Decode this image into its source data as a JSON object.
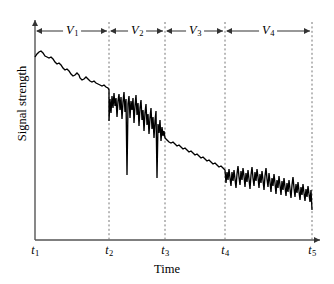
{
  "chart_data": {
    "type": "line",
    "title": "",
    "xlabel": "Time",
    "ylabel": "Signal strength",
    "grid": false,
    "legend": null,
    "axis_style": "arrow-headed axes, no numeric ticks",
    "xticks": [
      {
        "id": "t1",
        "label": "t",
        "sub": "1",
        "x_px": 35
      },
      {
        "id": "t2",
        "label": "t",
        "sub": "2",
        "x_px": 109
      },
      {
        "id": "t3",
        "label": "t",
        "sub": "3",
        "x_px": 165
      },
      {
        "id": "t4",
        "label": "t",
        "sub": "4",
        "x_px": 225
      },
      {
        "id": "t5",
        "label": "t",
        "sub": "5",
        "x_px": 312
      }
    ],
    "segments": [
      {
        "id": "V1",
        "label": "V",
        "sub": "1",
        "from": "t1",
        "to": "t2",
        "center_px": 72,
        "description": "slow smooth decline, low variance ripple"
      },
      {
        "id": "V2",
        "label": "V",
        "sub": "2",
        "from": "t2",
        "to": "t3",
        "center_px": 137,
        "description": "steep decline with very large rapid fading spikes"
      },
      {
        "id": "V3",
        "label": "V",
        "sub": "3",
        "from": "t3",
        "to": "t4",
        "center_px": 195,
        "description": "gentle decline, small ripple"
      },
      {
        "id": "V4",
        "label": "V",
        "sub": "4",
        "from": "t4",
        "to": "t5",
        "center_px": 268,
        "description": "slow decline with medium rapid fading oscillation"
      }
    ],
    "series": [
      {
        "name": "signal",
        "points": [
          [
            35,
            57
          ],
          [
            37,
            54
          ],
          [
            39,
            52
          ],
          [
            41,
            51
          ],
          [
            43,
            53
          ],
          [
            45,
            56
          ],
          [
            47,
            57
          ],
          [
            49,
            58
          ],
          [
            51,
            57
          ],
          [
            53,
            59
          ],
          [
            55,
            62
          ],
          [
            57,
            64
          ],
          [
            59,
            63
          ],
          [
            61,
            65
          ],
          [
            63,
            68
          ],
          [
            65,
            70
          ],
          [
            67,
            69
          ],
          [
            69,
            71
          ],
          [
            71,
            74
          ],
          [
            73,
            76
          ],
          [
            75,
            75
          ],
          [
            77,
            73
          ],
          [
            79,
            75
          ],
          [
            80,
            78
          ],
          [
            82,
            80
          ],
          [
            84,
            79
          ],
          [
            86,
            77
          ],
          [
            88,
            79
          ],
          [
            90,
            81
          ],
          [
            92,
            82
          ],
          [
            94,
            81
          ],
          [
            96,
            83
          ],
          [
            98,
            84
          ],
          [
            100,
            85
          ],
          [
            102,
            86
          ],
          [
            104,
            85
          ],
          [
            106,
            87
          ],
          [
            108,
            88
          ],
          [
            109,
            90
          ],
          [
            109,
            121
          ],
          [
            110,
            99
          ],
          [
            111,
            113
          ],
          [
            112,
            96
          ],
          [
            113,
            108
          ],
          [
            114,
            93
          ],
          [
            115,
            106
          ],
          [
            116,
            98
          ],
          [
            117,
            117
          ],
          [
            118,
            101
          ],
          [
            119,
            94
          ],
          [
            120,
            110
          ],
          [
            121,
            97
          ],
          [
            122,
            119
          ],
          [
            123,
            102
          ],
          [
            124,
            92
          ],
          [
            125,
            112
          ],
          [
            126,
            99
          ],
          [
            127,
            175
          ],
          [
            128,
            104
          ],
          [
            129,
            96
          ],
          [
            130,
            118
          ],
          [
            131,
            101
          ],
          [
            132,
            110
          ],
          [
            133,
            98
          ],
          [
            134,
            123
          ],
          [
            135,
            106
          ],
          [
            136,
            95
          ],
          [
            137,
            115
          ],
          [
            138,
            103
          ],
          [
            139,
            126
          ],
          [
            140,
            108
          ],
          [
            141,
            100
          ],
          [
            142,
            120
          ],
          [
            143,
            110
          ],
          [
            144,
            131
          ],
          [
            145,
            113
          ],
          [
            146,
            104
          ],
          [
            147,
            125
          ],
          [
            148,
            114
          ],
          [
            149,
            134
          ],
          [
            150,
            118
          ],
          [
            151,
            108
          ],
          [
            152,
            129
          ],
          [
            153,
            117
          ],
          [
            154,
            138
          ],
          [
            155,
            121
          ],
          [
            156,
            111
          ],
          [
            157,
            178
          ],
          [
            158,
            124
          ],
          [
            159,
            133
          ],
          [
            160,
            120
          ],
          [
            161,
            141
          ],
          [
            162,
            127
          ],
          [
            163,
            136
          ],
          [
            164,
            131
          ],
          [
            165,
            138
          ],
          [
            167,
            140
          ],
          [
            169,
            142
          ],
          [
            171,
            143
          ],
          [
            173,
            142
          ],
          [
            175,
            144
          ],
          [
            177,
            146
          ],
          [
            179,
            145
          ],
          [
            181,
            147
          ],
          [
            183,
            149
          ],
          [
            185,
            148
          ],
          [
            187,
            150
          ],
          [
            189,
            152
          ],
          [
            191,
            151
          ],
          [
            193,
            153
          ],
          [
            195,
            155
          ],
          [
            197,
            154
          ],
          [
            199,
            156
          ],
          [
            201,
            158
          ],
          [
            203,
            157
          ],
          [
            205,
            159
          ],
          [
            207,
            161
          ],
          [
            209,
            160
          ],
          [
            211,
            162
          ],
          [
            213,
            164
          ],
          [
            215,
            163
          ],
          [
            217,
            165
          ],
          [
            219,
            167
          ],
          [
            221,
            166
          ],
          [
            223,
            168
          ],
          [
            225,
            170
          ],
          [
            226,
            183
          ],
          [
            227,
            172
          ],
          [
            228,
            180
          ],
          [
            229,
            169
          ],
          [
            230,
            178
          ],
          [
            231,
            186
          ],
          [
            232,
            172
          ],
          [
            233,
            181
          ],
          [
            234,
            170
          ],
          [
            235,
            179
          ],
          [
            236,
            188
          ],
          [
            237,
            174
          ],
          [
            238,
            166
          ],
          [
            239,
            177
          ],
          [
            240,
            185
          ],
          [
            241,
            171
          ],
          [
            242,
            180
          ],
          [
            243,
            168
          ],
          [
            244,
            176
          ],
          [
            245,
            187
          ],
          [
            246,
            173
          ],
          [
            247,
            182
          ],
          [
            248,
            170
          ],
          [
            249,
            179
          ],
          [
            250,
            189
          ],
          [
            251,
            175
          ],
          [
            252,
            167
          ],
          [
            253,
            178
          ],
          [
            254,
            186
          ],
          [
            255,
            172
          ],
          [
            256,
            181
          ],
          [
            257,
            169
          ],
          [
            258,
            177
          ],
          [
            259,
            188
          ],
          [
            260,
            174
          ],
          [
            261,
            183
          ],
          [
            262,
            171
          ],
          [
            263,
            180
          ],
          [
            264,
            190
          ],
          [
            265,
            176
          ],
          [
            266,
            168
          ],
          [
            267,
            179
          ],
          [
            268,
            187
          ],
          [
            269,
            173
          ],
          [
            270,
            182
          ],
          [
            271,
            192
          ],
          [
            272,
            178
          ],
          [
            273,
            186
          ],
          [
            274,
            174
          ],
          [
            275,
            183
          ],
          [
            276,
            194
          ],
          [
            277,
            180
          ],
          [
            278,
            188
          ],
          [
            279,
            176
          ],
          [
            280,
            185
          ],
          [
            281,
            195
          ],
          [
            282,
            181
          ],
          [
            283,
            190
          ],
          [
            284,
            178
          ],
          [
            285,
            187
          ],
          [
            286,
            196
          ],
          [
            287,
            183
          ],
          [
            288,
            192
          ],
          [
            289,
            180
          ],
          [
            290,
            189
          ],
          [
            291,
            198
          ],
          [
            292,
            185
          ],
          [
            293,
            177
          ],
          [
            294,
            188
          ],
          [
            295,
            197
          ],
          [
            296,
            184
          ],
          [
            297,
            193
          ],
          [
            298,
            182
          ],
          [
            299,
            191
          ],
          [
            300,
            200
          ],
          [
            301,
            187
          ],
          [
            302,
            195
          ],
          [
            303,
            184
          ],
          [
            304,
            193
          ],
          [
            305,
            201
          ],
          [
            306,
            189
          ],
          [
            307,
            197
          ],
          [
            308,
            186
          ],
          [
            309,
            194
          ],
          [
            310,
            202
          ],
          [
            311,
            190
          ],
          [
            312,
            210
          ]
        ]
      }
    ]
  },
  "geometry": {
    "axis_x_px": 35,
    "axis_baseline_y_px": 240,
    "axis_top_y_px": 18,
    "axis_right_px": 322,
    "segment_arrow_y_px": 31,
    "tick_label_y_px": 243,
    "plot_width": 334,
    "plot_height": 284
  },
  "colors": {
    "background": "#ffffff",
    "line": "#000000",
    "axis": "#555555",
    "dashed_marker": "#777777",
    "text": "#000000"
  }
}
